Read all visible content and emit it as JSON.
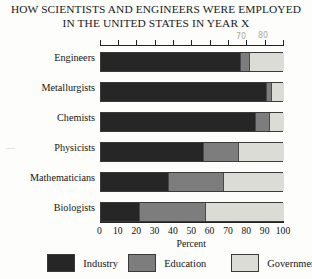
{
  "title": {
    "line1": "HOW SCIENTISTS AND ENGINEERS WERE EMPLOYED",
    "line2": "IN THE UNITED STATES IN YEAR X"
  },
  "annotations": {
    "top_70": "70",
    "top_80": "80",
    "bar_mark_1": "81",
    "bar_mark_2": "3"
  },
  "legend": {
    "position": "bottom",
    "items": [
      {
        "label": "Industry",
        "color": "#262626"
      },
      {
        "label": "Education",
        "color": "#7d7d7d"
      },
      {
        "label": "Government",
        "color": "#dcdcd6"
      }
    ]
  },
  "chart_data": {
    "type": "bar",
    "orientation": "horizontal",
    "stacked": true,
    "title": "HOW SCIENTISTS AND ENGINEERS WERE EMPLOYED IN THE UNITED STATES IN YEAR X",
    "xlabel": "Percent",
    "ylabel": "",
    "xlim": [
      0,
      100
    ],
    "xticks": [
      0,
      10,
      20,
      30,
      40,
      50,
      60,
      70,
      80,
      90,
      100
    ],
    "xticklabels": [
      "0",
      "10",
      "20",
      "30",
      "40",
      "50",
      "60",
      "70",
      "80",
      "90",
      "100"
    ],
    "grid": false,
    "categories": [
      "Engineers",
      "Metallurgists",
      "Chemists",
      "Physicists",
      "Mathematicians",
      "Biologists"
    ],
    "series": [
      {
        "name": "Industry",
        "color": "#262626",
        "values": [
          76,
          90,
          84,
          56,
          37,
          21
        ]
      },
      {
        "name": "Education",
        "color": "#7d7d7d",
        "values": [
          5,
          3,
          8,
          19,
          30,
          36
        ]
      },
      {
        "name": "Government",
        "color": "#dcdcd6",
        "values": [
          19,
          7,
          8,
          25,
          33,
          43
        ]
      }
    ]
  }
}
